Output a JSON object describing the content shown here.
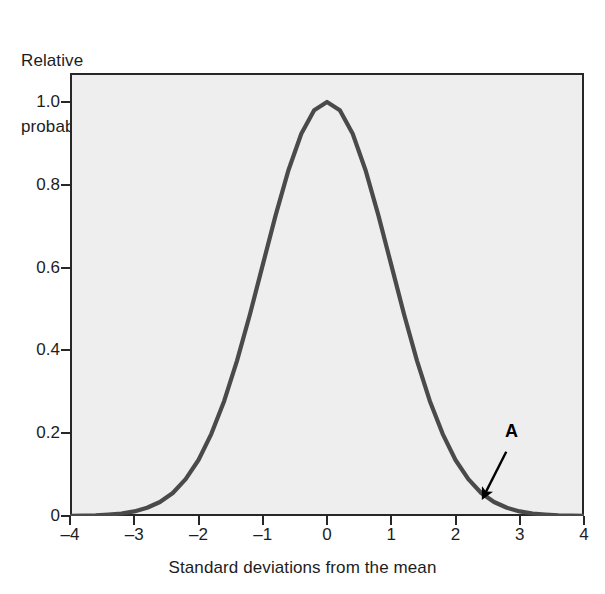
{
  "figure": {
    "name": "normal-distribution-curve",
    "background": "#ffffff",
    "plot_background": "#eeeeee",
    "frame_color": "#272727",
    "curve_color": "#4a4a4a",
    "annotation_color": "#000000"
  },
  "chart_data": {
    "type": "line",
    "title": "",
    "xlabel": "Standard deviations from the mean",
    "ylabel": "Relative probability",
    "ylabel_lines": [
      "Relative",
      "probability"
    ],
    "xlim": [
      -4,
      4
    ],
    "ylim": [
      0,
      1.07
    ],
    "grid": false,
    "legend": false,
    "xticks": [
      -4,
      -3,
      -2,
      -1,
      0,
      1,
      2,
      3,
      4
    ],
    "xtick_labels": [
      "–4",
      "–3",
      "–2",
      "–1",
      "0",
      "1",
      "2",
      "3",
      "4"
    ],
    "yticks": [
      0,
      0.2,
      0.4,
      0.6,
      0.8,
      1.0
    ],
    "ytick_labels": [
      "0",
      "0.2",
      "0.4",
      "0.6",
      "0.8",
      "1.0"
    ],
    "series": [
      {
        "name": "relative probability",
        "formula": "exp(-x^2/2)",
        "x": [
          -4.0,
          -3.8,
          -3.6,
          -3.4,
          -3.2,
          -3.0,
          -2.8,
          -2.6,
          -2.4,
          -2.2,
          -2.0,
          -1.8,
          -1.6,
          -1.4,
          -1.2,
          -1.0,
          -0.8,
          -0.6,
          -0.4,
          -0.2,
          0.0,
          0.2,
          0.4,
          0.6,
          0.8,
          1.0,
          1.2,
          1.4,
          1.6,
          1.8,
          2.0,
          2.2,
          2.4,
          2.6,
          2.8,
          3.0,
          3.2,
          3.4,
          3.6,
          3.8,
          4.0
        ],
        "y": [
          0.000335,
          0.000687,
          0.001363,
          0.00362,
          0.00596,
          0.011109,
          0.019841,
          0.033737,
          0.055576,
          0.088922,
          0.135335,
          0.19841,
          0.278037,
          0.375311,
          0.486752,
          0.606531,
          0.726149,
          0.83527,
          0.923116,
          0.980199,
          1.0,
          0.980199,
          0.923116,
          0.83527,
          0.726149,
          0.606531,
          0.486752,
          0.375311,
          0.278037,
          0.19841,
          0.135335,
          0.088922,
          0.055576,
          0.033737,
          0.019841,
          0.011109,
          0.00596,
          0.00362,
          0.001363,
          0.000687,
          0.000335
        ]
      }
    ],
    "annotations": [
      {
        "label": "A",
        "label_x": 2.87,
        "label_y": 0.205,
        "arrow_from_x": 2.79,
        "arrow_from_y": 0.155,
        "arrow_to_x": 2.43,
        "arrow_to_y": 0.045
      }
    ]
  }
}
